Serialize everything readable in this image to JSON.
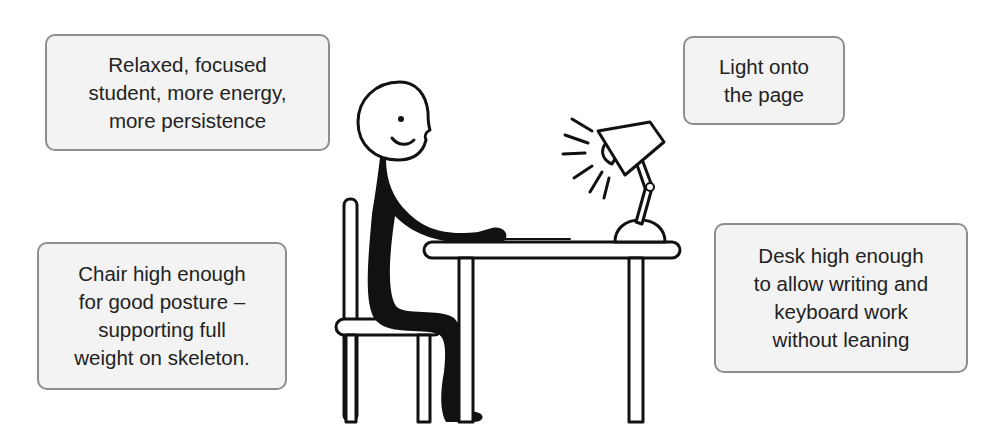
{
  "diagram": {
    "callouts": {
      "student": {
        "lines": [
          "Relaxed, focused",
          "student, more energy,",
          "more persistence"
        ]
      },
      "light": {
        "lines": [
          "Light onto",
          "the page"
        ]
      },
      "chair": {
        "lines": [
          "Chair high enough",
          "for good posture –",
          "supporting full",
          "weight on skeleton."
        ]
      },
      "desk": {
        "lines": [
          "Desk high enough",
          "to allow writing and",
          "keyboard work",
          "without leaning"
        ]
      }
    },
    "figure": {
      "elements": [
        "stick-figure-student",
        "chair",
        "desk",
        "paper",
        "desk-lamp",
        "light-rays"
      ]
    },
    "colors": {
      "callout_fill": "#f3f3f3",
      "callout_border": "#8e8e8e",
      "ink": "#111111"
    }
  }
}
